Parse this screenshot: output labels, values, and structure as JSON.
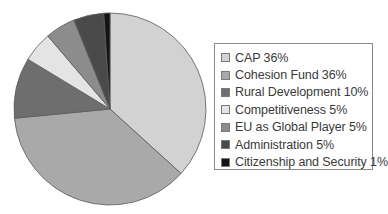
{
  "chart_data": {
    "type": "pie",
    "title": "",
    "categories": [
      "CAP",
      "Cohesion Fund",
      "Rural Development",
      "Competitiveness",
      "EU as Global Player",
      "Administration",
      "Citizenship and Security"
    ],
    "values": [
      36,
      36,
      10,
      5,
      5,
      5,
      1
    ],
    "colors": [
      "#d2d2d2",
      "#a9a9a9",
      "#6e6e6e",
      "#e4e4e4",
      "#8c8c8c",
      "#4a4a4a",
      "#141414"
    ],
    "start_angle_deg": 0,
    "direction": "clockwise",
    "legend_position": "right",
    "legend": [
      {
        "label": "CAP 36%"
      },
      {
        "label": "Cohesion Fund 36%"
      },
      {
        "label": "Rural Development 10%"
      },
      {
        "label": "Competitiveness 5%"
      },
      {
        "label": "EU as Global Player 5%"
      },
      {
        "label": "Administration 5%"
      },
      {
        "label": "Citizenship and Security 1%"
      }
    ]
  }
}
